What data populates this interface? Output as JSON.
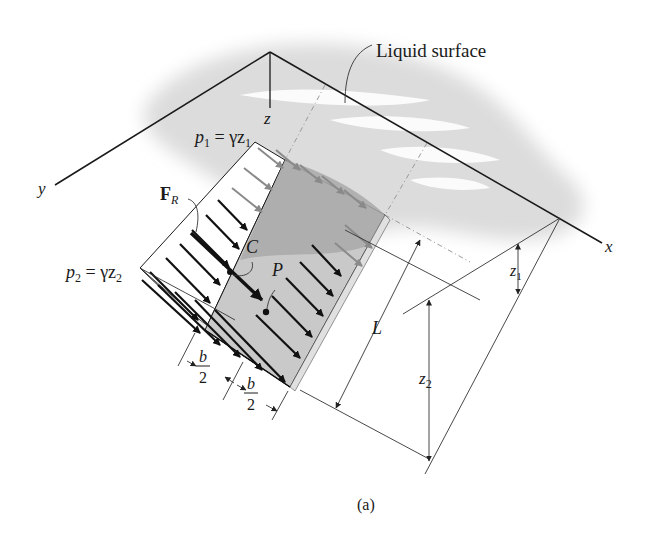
{
  "figure": {
    "caption": "(a)",
    "callouts": {
      "liquid_surface": "Liquid surface"
    },
    "axes": {
      "x": "x",
      "y": "y",
      "z": "z"
    },
    "pressures": {
      "p1": {
        "sym": "p",
        "sub": "1",
        "eq": " = γz",
        "eqsub": "1"
      },
      "p2": {
        "sym": "p",
        "sub": "2",
        "eq": " = γz",
        "eqsub": "2"
      }
    },
    "force": {
      "sym": "F",
      "sub": "R"
    },
    "points": {
      "centroid": "C",
      "center_of_pressure": "P"
    },
    "dimensions": {
      "length": "L",
      "half_width_num": "b",
      "half_width_den": "2",
      "depth1_sym": "z",
      "depth1_sub": "1",
      "depth2_sym": "z",
      "depth2_sub": "2"
    },
    "colors": {
      "line": "#1a1a1a",
      "plate_light": "#c8c8c8",
      "plate_dark": "#a6a6a6",
      "liquid": "#e2e2e2",
      "grey_arrow": "#8a8a8a"
    }
  }
}
